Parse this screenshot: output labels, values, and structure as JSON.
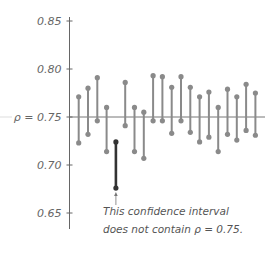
{
  "chart_data": {
    "type": "interval",
    "title": "",
    "xlabel": "",
    "ylabel": "",
    "ylim": [
      0.65,
      0.85
    ],
    "yticks": [
      0.85,
      0.8,
      0.75,
      0.7,
      0.65
    ],
    "ytick_labels": [
      "0.85",
      "0.80",
      "ρ = 0.75",
      "0.70",
      "0.65"
    ],
    "reference_line": {
      "value": 0.75,
      "label": "ρ = 0.75"
    },
    "grid": false,
    "series": [
      {
        "name": "Confidence intervals",
        "intervals": [
          {
            "index": 1,
            "lower": 0.723,
            "upper": 0.771
          },
          {
            "index": 2,
            "lower": 0.732,
            "upper": 0.78
          },
          {
            "index": 3,
            "lower": 0.746,
            "upper": 0.791
          },
          {
            "index": 4,
            "lower": 0.714,
            "upper": 0.76
          },
          {
            "index": 5,
            "lower": 0.676,
            "upper": 0.724,
            "highlighted": true
          },
          {
            "index": 6,
            "lower": 0.741,
            "upper": 0.786
          },
          {
            "index": 7,
            "lower": 0.714,
            "upper": 0.76
          },
          {
            "index": 8,
            "lower": 0.707,
            "upper": 0.755
          },
          {
            "index": 9,
            "lower": 0.746,
            "upper": 0.793
          },
          {
            "index": 10,
            "lower": 0.746,
            "upper": 0.792
          },
          {
            "index": 11,
            "lower": 0.733,
            "upper": 0.781
          },
          {
            "index": 12,
            "lower": 0.746,
            "upper": 0.792
          },
          {
            "index": 13,
            "lower": 0.734,
            "upper": 0.781
          },
          {
            "index": 14,
            "lower": 0.724,
            "upper": 0.771
          },
          {
            "index": 15,
            "lower": 0.729,
            "upper": 0.776
          },
          {
            "index": 16,
            "lower": 0.714,
            "upper": 0.76
          },
          {
            "index": 17,
            "lower": 0.732,
            "upper": 0.779
          },
          {
            "index": 18,
            "lower": 0.726,
            "upper": 0.771
          },
          {
            "index": 19,
            "lower": 0.736,
            "upper": 0.784
          },
          {
            "index": 20,
            "lower": 0.731,
            "upper": 0.775
          }
        ]
      }
    ],
    "annotations": [
      {
        "text_lines": [
          "This confidence interval",
          "does not contain ρ = 0.75."
        ],
        "points_to_index": 5
      }
    ]
  },
  "colors": {
    "interval": "#8a8a8a",
    "highlight": "#333333",
    "axis": "#666666",
    "reference_line": "#777777",
    "text": "#555555"
  }
}
